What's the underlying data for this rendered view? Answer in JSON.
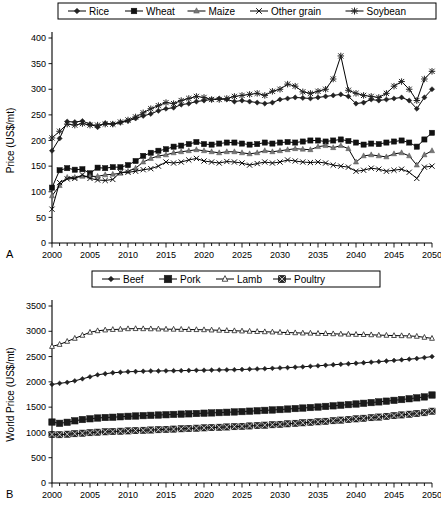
{
  "figure": {
    "panels": [
      {
        "id": "A",
        "label": "A",
        "legend": [
          {
            "name": "Rice",
            "marker": "diamond"
          },
          {
            "name": "Wheat",
            "marker": "square"
          },
          {
            "name": "Maize",
            "marker": "triangle"
          },
          {
            "name": "Other grain",
            "marker": "x"
          },
          {
            "name": "Soybean",
            "marker": "star"
          }
        ]
      },
      {
        "id": "B",
        "label": "B",
        "legend": [
          {
            "name": "Beef",
            "marker": "diamond"
          },
          {
            "name": "Pork",
            "marker": "square-big"
          },
          {
            "name": "Lamb",
            "marker": "triangle-open"
          },
          {
            "name": "Poultry",
            "marker": "square-x"
          }
        ]
      }
    ]
  },
  "chart_data": [
    {
      "type": "line",
      "panel": "A",
      "title": "",
      "xlabel": "",
      "ylabel": "Price (US$/mt)",
      "xlim": [
        2000,
        2050
      ],
      "ylim": [
        0,
        400
      ],
      "ytick_step": 50,
      "xtick_label_step": 5,
      "xtick_step": 1,
      "grid": false,
      "legend_position": "top",
      "x": [
        2000,
        2001,
        2002,
        2003,
        2004,
        2005,
        2006,
        2007,
        2008,
        2009,
        2010,
        2011,
        2012,
        2013,
        2014,
        2015,
        2016,
        2017,
        2018,
        2019,
        2020,
        2021,
        2022,
        2023,
        2024,
        2025,
        2026,
        2027,
        2028,
        2029,
        2030,
        2031,
        2032,
        2033,
        2034,
        2035,
        2036,
        2037,
        2038,
        2039,
        2040,
        2041,
        2042,
        2043,
        2044,
        2045,
        2046,
        2047,
        2048,
        2049,
        2050
      ],
      "series": [
        {
          "name": "Rice",
          "marker": "diamond",
          "values": [
            180,
            204,
            237,
            236,
            238,
            232,
            226,
            234,
            232,
            235,
            238,
            243,
            248,
            252,
            258,
            262,
            264,
            270,
            272,
            276,
            278,
            280,
            282,
            280,
            276,
            278,
            276,
            274,
            272,
            274,
            280,
            282,
            284,
            283,
            282,
            284,
            286,
            288,
            290,
            286,
            272,
            274,
            280,
            278,
            280,
            282,
            284,
            278,
            262,
            284,
            300
          ]
        },
        {
          "name": "Wheat",
          "marker": "square",
          "values": [
            108,
            142,
            146,
            143,
            144,
            136,
            147,
            146,
            148,
            148,
            152,
            160,
            170,
            176,
            180,
            183,
            188,
            190,
            193,
            197,
            193,
            192,
            194,
            196,
            196,
            194,
            192,
            193,
            196,
            194,
            196,
            197,
            196,
            198,
            200,
            200,
            198,
            200,
            202,
            199,
            196,
            192,
            194,
            193,
            196,
            198,
            200,
            196,
            188,
            202,
            215
          ]
        },
        {
          "name": "Maize",
          "marker": "triangle",
          "values": [
            92,
            112,
            128,
            128,
            130,
            130,
            130,
            133,
            134,
            136,
            140,
            146,
            158,
            165,
            170,
            172,
            176,
            178,
            180,
            182,
            180,
            178,
            176,
            178,
            178,
            176,
            174,
            176,
            180,
            178,
            180,
            182,
            184,
            183,
            182,
            188,
            190,
            186,
            190,
            184,
            158,
            170,
            172,
            170,
            168,
            174,
            176,
            170,
            152,
            172,
            180
          ]
        },
        {
          "name": "Other grain",
          "marker": "x",
          "values": [
            66,
            118,
            125,
            126,
            133,
            126,
            123,
            122,
            124,
            138,
            138,
            140,
            143,
            145,
            150,
            158,
            156,
            158,
            162,
            165,
            160,
            158,
            156,
            159,
            158,
            156,
            152,
            155,
            158,
            156,
            158,
            162,
            160,
            158,
            157,
            158,
            156,
            152,
            150,
            148,
            140,
            142,
            146,
            144,
            140,
            142,
            144,
            138,
            126,
            148,
            150
          ]
        },
        {
          "name": "Soybean",
          "marker": "star",
          "values": [
            205,
            218,
            232,
            230,
            233,
            230,
            230,
            232,
            232,
            236,
            240,
            246,
            254,
            262,
            268,
            274,
            272,
            278,
            282,
            286,
            284,
            280,
            280,
            282,
            286,
            288,
            290,
            292,
            288,
            296,
            300,
            310,
            306,
            295,
            292,
            296,
            300,
            320,
            365,
            298,
            292,
            288,
            286,
            284,
            292,
            306,
            315,
            300,
            278,
            320,
            335
          ]
        }
      ]
    },
    {
      "type": "line",
      "panel": "B",
      "title": "",
      "xlabel": "",
      "ylabel": "World Price (US$/mt)",
      "xlim": [
        2000,
        2050
      ],
      "ylim": [
        0,
        3500
      ],
      "ytick_step": 500,
      "xtick_label_step": 5,
      "xtick_step": 1,
      "grid": false,
      "legend_position": "top",
      "x": [
        2000,
        2001,
        2002,
        2003,
        2004,
        2005,
        2006,
        2007,
        2008,
        2009,
        2010,
        2011,
        2012,
        2013,
        2014,
        2015,
        2016,
        2017,
        2018,
        2019,
        2020,
        2021,
        2022,
        2023,
        2024,
        2025,
        2026,
        2027,
        2028,
        2029,
        2030,
        2031,
        2032,
        2033,
        2034,
        2035,
        2036,
        2037,
        2038,
        2039,
        2040,
        2041,
        2042,
        2043,
        2044,
        2045,
        2046,
        2047,
        2048,
        2049,
        2050
      ],
      "series": [
        {
          "name": "Beef",
          "marker": "diamond",
          "values": [
            1950,
            1970,
            1990,
            2020,
            2060,
            2100,
            2140,
            2160,
            2180,
            2190,
            2200,
            2205,
            2210,
            2215,
            2215,
            2218,
            2220,
            2222,
            2225,
            2228,
            2230,
            2232,
            2235,
            2238,
            2240,
            2245,
            2250,
            2255,
            2260,
            2268,
            2275,
            2282,
            2290,
            2298,
            2308,
            2318,
            2328,
            2338,
            2348,
            2358,
            2368,
            2378,
            2390,
            2400,
            2412,
            2424,
            2436,
            2448,
            2462,
            2480,
            2500
          ]
        },
        {
          "name": "Pork",
          "marker": "square-big",
          "values": [
            1205,
            1180,
            1200,
            1230,
            1255,
            1270,
            1285,
            1295,
            1300,
            1310,
            1318,
            1325,
            1332,
            1338,
            1344,
            1350,
            1356,
            1362,
            1368,
            1374,
            1380,
            1386,
            1392,
            1398,
            1405,
            1412,
            1420,
            1428,
            1436,
            1444,
            1452,
            1462,
            1472,
            1482,
            1492,
            1502,
            1514,
            1526,
            1538,
            1550,
            1562,
            1576,
            1590,
            1604,
            1618,
            1634,
            1650,
            1666,
            1684,
            1702,
            1740
          ]
        },
        {
          "name": "Lamb",
          "marker": "triangle-open",
          "values": [
            2700,
            2740,
            2800,
            2860,
            2920,
            2980,
            3010,
            3025,
            3035,
            3040,
            3050,
            3052,
            3050,
            3048,
            3045,
            3042,
            3040,
            3038,
            3035,
            3032,
            3030,
            3025,
            3020,
            3015,
            3010,
            3005,
            3000,
            2995,
            2990,
            2985,
            2980,
            2975,
            2970,
            2965,
            2962,
            2958,
            2955,
            2950,
            2945,
            2942,
            2938,
            2935,
            2930,
            2925,
            2920,
            2915,
            2912,
            2908,
            2900,
            2880,
            2860
          ]
        },
        {
          "name": "Poultry",
          "marker": "square-x",
          "values": [
            960,
            955,
            965,
            975,
            985,
            995,
            1005,
            1012,
            1018,
            1024,
            1030,
            1036,
            1042,
            1048,
            1054,
            1060,
            1066,
            1072,
            1078,
            1084,
            1090,
            1096,
            1102,
            1108,
            1114,
            1120,
            1128,
            1136,
            1144,
            1152,
            1160,
            1170,
            1180,
            1190,
            1200,
            1210,
            1220,
            1232,
            1244,
            1256,
            1268,
            1280,
            1292,
            1304,
            1318,
            1332,
            1346,
            1360,
            1374,
            1390,
            1420
          ]
        }
      ]
    }
  ]
}
